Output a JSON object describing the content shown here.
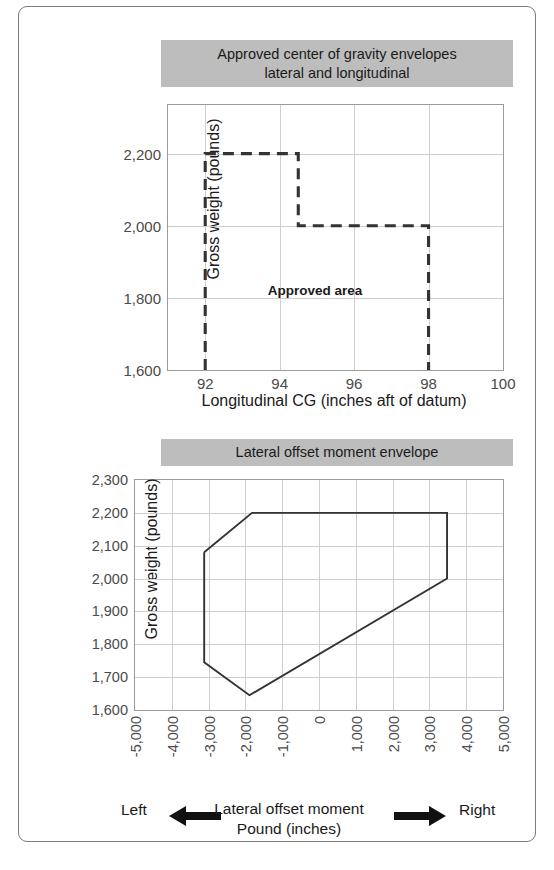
{
  "figure": {
    "frame_border_color": "#7c7c7c",
    "title_band_color": "#bdbdbd",
    "grid_color": "#cfcfcf",
    "envelope_color": "#333333"
  },
  "chart_data": [
    {
      "type": "line",
      "name": "approved-cg-envelope",
      "title": "Approved center of gravity envelopes lateral and longitudinal",
      "title_line1": "Approved center of gravity envelopes",
      "title_line2": "lateral and longitudinal",
      "xlabel": "Longitudinal CG (inches aft of datum)",
      "ylabel": "Gross weight (pounds)",
      "xlim": [
        91,
        100
      ],
      "ylim": [
        1600,
        2335
      ],
      "xticks": [
        92,
        94,
        96,
        98,
        100
      ],
      "xtick_labels": [
        "92",
        "94",
        "96",
        "98",
        "100"
      ],
      "yticks": [
        1600,
        1800,
        2000,
        2200
      ],
      "ytick_labels": [
        "1,600",
        "1,800",
        "2,000",
        "2,200"
      ],
      "grid": true,
      "linestyle": "dashed",
      "annotations": [
        {
          "text": "Approved area",
          "x": 94.95,
          "y": 1822
        }
      ],
      "envelope_points": [
        {
          "x": 92,
          "y": 1600
        },
        {
          "x": 92,
          "y": 2200
        },
        {
          "x": 94.5,
          "y": 2200
        },
        {
          "x": 94.5,
          "y": 2000
        },
        {
          "x": 98,
          "y": 2000
        },
        {
          "x": 98,
          "y": 1600
        }
      ]
    },
    {
      "type": "line",
      "name": "lateral-offset-moment-envelope",
      "title": "Lateral offset moment envelope",
      "xlabel": "Lateral offset moment Pound (inches)",
      "xlabel_line1": "Lateral offset moment",
      "xlabel_line2": "Pound (inches)",
      "ylabel": "Gross weight (pounds)",
      "xlim": [
        -5000,
        5000
      ],
      "ylim": [
        1600,
        2300
      ],
      "xticks": [
        -5000,
        -4000,
        -3000,
        -2000,
        -1000,
        0,
        1000,
        2000,
        3000,
        4000,
        5000
      ],
      "xtick_labels": [
        "-5,000",
        "-4,000",
        "-3,000",
        "-2,000",
        "-1,000",
        "0",
        "1,000",
        "2,000",
        "3,000",
        "4,000",
        "5,000"
      ],
      "yticks": [
        1600,
        1700,
        1800,
        1900,
        2000,
        2100,
        2200,
        2300
      ],
      "ytick_labels": [
        "1,600",
        "1,700",
        "1,800",
        "1,900",
        "2,000",
        "2,100",
        "2,200",
        "2,300"
      ],
      "grid": true,
      "linestyle": "solid",
      "envelope_points": [
        {
          "x": -3120,
          "y": 2080
        },
        {
          "x": -1820,
          "y": 2200
        },
        {
          "x": 3480,
          "y": 2200
        },
        {
          "x": 3480,
          "y": 2000
        },
        {
          "x": -1890,
          "y": 1645
        },
        {
          "x": -3120,
          "y": 1745
        },
        {
          "x": -3120,
          "y": 2080
        }
      ],
      "footer": {
        "left_label": "Left",
        "right_label": "Right",
        "left_arrow": "left-arrow-icon",
        "right_arrow": "right-arrow-icon"
      }
    }
  ]
}
